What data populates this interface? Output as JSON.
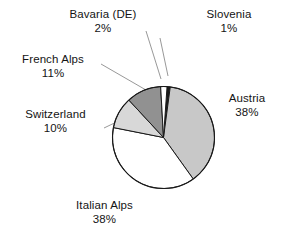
{
  "chart_data": {
    "type": "pie",
    "title": "",
    "subtitle": "",
    "xlabel": "",
    "ylabel": "",
    "legend_position": "none",
    "grid": false,
    "value_unit": "%",
    "categories": [
      "Slovenia",
      "Austria",
      "Italian Alps",
      "Switzerland",
      "French Alps",
      "Bavaria (DE)"
    ],
    "values": [
      1,
      38,
      38,
      10,
      11,
      2
    ],
    "slices": [
      {
        "label": "Slovenia",
        "value": 1,
        "value_label": "1%",
        "color": "#1a1a1a",
        "start_angle": 0,
        "end_angle": 3.6,
        "has_leader_line": true
      },
      {
        "label": "Austria",
        "value": 38,
        "value_label": "38%",
        "color": "#c8c8c8",
        "start_angle": 3.6,
        "end_angle": 140.4,
        "has_leader_line": false
      },
      {
        "label": "Italian Alps",
        "value": 38,
        "value_label": "38%",
        "color": "#ffffff",
        "start_angle": 140.4,
        "end_angle": 277.2,
        "has_leader_line": false
      },
      {
        "label": "Switzerland",
        "value": 10,
        "value_label": "10%",
        "color": "#d8d8d8",
        "start_angle": 277.2,
        "end_angle": 313.2,
        "has_leader_line": true
      },
      {
        "label": "French Alps",
        "value": 11,
        "value_label": "11%",
        "color": "#919191",
        "start_angle": 313.2,
        "end_angle": 352.8,
        "has_leader_line": true
      },
      {
        "label": "Bavaria (DE)",
        "value": 2,
        "value_label": "2%",
        "color": "#ffffff",
        "start_angle": 352.8,
        "end_angle": 360,
        "has_leader_line": true
      }
    ],
    "colors": {
      "outline": "#1a1a1a",
      "leader_line": "#8c8c8c",
      "text": "#141414",
      "background": "#ffffff"
    }
  },
  "labels": {
    "bavaria": {
      "name": "Bavaria (DE)",
      "value": "2%"
    },
    "slovenia": {
      "name": "Slovenia",
      "value": "1%"
    },
    "french_alps": {
      "name": "French Alps",
      "value": "11%"
    },
    "switzerland": {
      "name": "Switzerland",
      "value": "10%"
    },
    "austria": {
      "name": "Austria",
      "value": "38%"
    },
    "italian_alps": {
      "name": "Italian Alps",
      "value": "38%"
    }
  }
}
